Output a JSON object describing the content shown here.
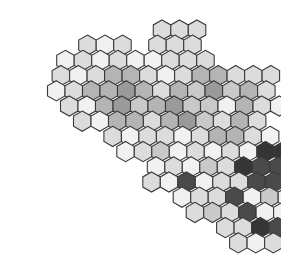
{
  "diagram": {
    "type": "hexagonal-cell-grid",
    "hex": {
      "width": 17.5,
      "row_height": 15.2,
      "origin_x": 22,
      "origin_y": 30
    },
    "shades": {
      "w": "#f1f1f1",
      "l": "#dcdcdc",
      "m": "#b4b4b4",
      "g": "#9a9a9a",
      "t": "#c9c9c9",
      "d": "#4a4a4a",
      "k": "#353535"
    },
    "rows": [
      {
        "r": 0,
        "c0": 8,
        "cells": "lll"
      },
      {
        "r": 1,
        "c0": 3,
        "cells": "lwl.lll"
      },
      {
        "r": 2,
        "c0": 2,
        "cells": "wlwlwwlll"
      },
      {
        "r": 3,
        "c0": 1,
        "cells": "lwlmmlwlmmlll"
      },
      {
        "r": 4,
        "c0": 1,
        "cells": "wlmmgmlmtgtml"
      },
      {
        "r": 5,
        "c0": 1,
        "cells": "lwmgtmgttwmlw"
      },
      {
        "r": 6,
        "c0": 2,
        "cells": "lwmmlmgtlml"
      },
      {
        "r": 7,
        "c0": 3,
        "cells": "lwllwlmmlw"
      },
      {
        "r": 8,
        "c0": 4,
        "cells": "wltwlwlwkkl"
      },
      {
        "r": 9,
        "c0": 5,
        "cells": "wlwtlkddkdkl"
      },
      {
        "r": 10,
        "c0": 5,
        "cells": "lwdwllddwwdk"
      },
      {
        "r": 11,
        "c0": 6,
        "cells": "wlldwtwdk"
      },
      {
        "r": 12,
        "c0": 7,
        "cells": "ltldwwdd"
      },
      {
        "r": 13,
        "c0": 8,
        "cells": "llkddkl"
      },
      {
        "r": 14,
        "c0": 9,
        "cells": "lwlll"
      }
    ]
  }
}
